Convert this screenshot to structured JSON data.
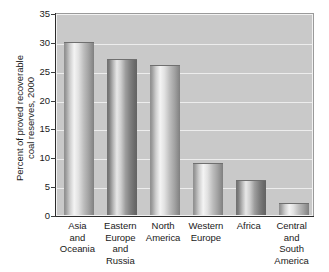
{
  "chart_data": {
    "type": "bar",
    "title": "",
    "subtitle": "",
    "xlabel": "",
    "ylabel": "Percent of proved recoverable coal reserves, 2000",
    "ylabel_lines": [
      "Percent of proved recoverable",
      "coal reserves, 2000"
    ],
    "categories": [
      "Asia and Oceania",
      "Eastern Europe and Russia",
      "North America",
      "Western Europe",
      "Africa",
      "Central and South America"
    ],
    "category_lines": [
      [
        "Asia",
        "and",
        "Oceania"
      ],
      [
        "Eastern",
        "Europe",
        "and",
        "Russia"
      ],
      [
        "North",
        "America"
      ],
      [
        "Western",
        "Europe"
      ],
      [
        "Africa"
      ],
      [
        "Central",
        "and",
        "South",
        "America"
      ]
    ],
    "values": [
      30,
      27,
      26,
      9,
      6,
      2
    ],
    "ylim": [
      0,
      35
    ],
    "ytick_labels": [
      "0",
      "5",
      "10",
      "15",
      "20",
      "25",
      "30",
      "35"
    ],
    "ytick_values": [
      0,
      5,
      10,
      15,
      20,
      25,
      30,
      35
    ],
    "grid": true,
    "grid_axis": "y",
    "legend": "none",
    "legend_position": "none",
    "colors": {
      "plot_background": "#c9c9c9",
      "gridline": "#ededed",
      "bar_light": "#cfcfcf",
      "bar_dark": "#8b8b8b",
      "axis": "#2b2b2b",
      "text": "#1a1a1a",
      "figure_background": "#ffffff"
    },
    "bar_shading": [
      "light",
      "dark",
      "light",
      "light",
      "dark",
      "light"
    ]
  }
}
